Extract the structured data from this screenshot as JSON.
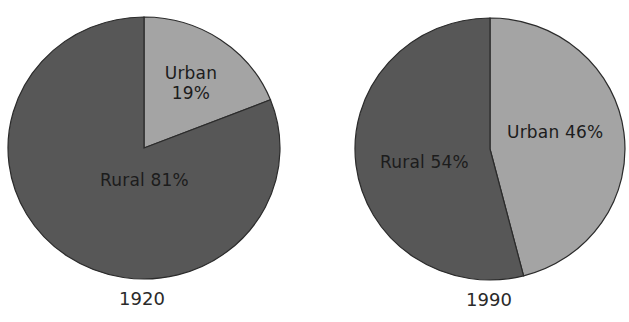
{
  "chart_data": [
    {
      "type": "pie",
      "title": "1920",
      "categories": [
        "Urban",
        "Rural"
      ],
      "values": [
        19,
        81
      ],
      "unit": "%",
      "labels": [
        "Urban 19%",
        "Rural 81%"
      ],
      "colors": {
        "Urban": "#a4a4a4",
        "Rural": "#575757"
      },
      "start_angle": "12 o'clock, clockwise"
    },
    {
      "type": "pie",
      "title": "1990",
      "categories": [
        "Urban",
        "Rural"
      ],
      "values": [
        46,
        54
      ],
      "unit": "%",
      "labels": [
        "Urban 46%",
        "Rural 54%"
      ],
      "colors": {
        "Urban": "#a4a4a4",
        "Rural": "#575757"
      },
      "start_angle": "12 o'clock, clockwise"
    }
  ],
  "pies": [
    {
      "year": "1920",
      "urban_label_line1": "Urban",
      "urban_label_line2": "19%",
      "rural_label": "Rural 81%"
    },
    {
      "year": "1990",
      "urban_label": "Urban 46%",
      "rural_label": "Rural 54%"
    }
  ],
  "colors": {
    "urban": "#a4a4a4",
    "rural": "#575757",
    "outline": "#2b2b2b"
  }
}
